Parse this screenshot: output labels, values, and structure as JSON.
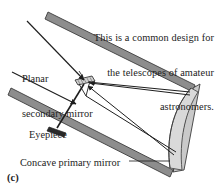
{
  "figure": {
    "letter": "(c)",
    "caption": {
      "lines": [
        "This is a common design for",
        "the telescopes of amateur",
        "astronomers."
      ]
    },
    "labels": {
      "secondary_mirror": {
        "lines": [
          "Planar",
          "secondary mirror"
        ],
        "full": "Planar secondary mirror"
      },
      "eyepiece": "Eyepiece",
      "primary_mirror": "Concave primary mirror"
    },
    "parts": [
      {
        "name": "telescope-tube",
        "description": "open tube of the reflecting telescope, shown in perspective"
      },
      {
        "name": "concave-primary-mirror",
        "description": "curved mirror at the far end of the tube"
      },
      {
        "name": "planar-secondary-mirror",
        "description": "small flat mirror tilted inside the tube near the opening"
      },
      {
        "name": "eyepiece",
        "description": "eyepiece barrel projecting from the side of the tube"
      },
      {
        "name": "incoming-light-rays",
        "description": "two parallel rays entering the tube from the upper left"
      },
      {
        "name": "reflected-light-rays",
        "description": "rays converging from the primary mirror back to the secondary mirror"
      }
    ],
    "colors": {
      "tube_wall": "#8d8d8d",
      "tube_wall_outline": "#3c3c3c",
      "mirror_fill": "#d8d8d8",
      "mirror_outline": "#4a4a4a",
      "ray": "#1e1e1e",
      "text": "#232323",
      "background": "#ffffff"
    }
  }
}
